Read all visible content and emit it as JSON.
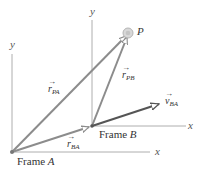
{
  "diagram": {
    "type": "relative-motion-reference-frames",
    "colors": {
      "axis": "#9a9a9a",
      "vector": "#8c8c8c",
      "velocity_vector": "#555555",
      "point": "#b0b0b0",
      "text": "#333333"
    },
    "frames": [
      {
        "name": "Frame A",
        "prefix": "Frame ",
        "letter": "A",
        "x_axis_label": "x",
        "y_axis_label": "y"
      },
      {
        "name": "Frame B",
        "prefix": "Frame ",
        "letter": "B",
        "x_axis_label": "x",
        "y_axis_label": "y"
      }
    ],
    "point": {
      "label": "P"
    },
    "vectors": [
      {
        "id": "r_PA",
        "symbol": "r",
        "subscript": "PA",
        "from": "Frame A origin",
        "to": "P"
      },
      {
        "id": "r_PB",
        "symbol": "r",
        "subscript": "PB",
        "from": "Frame B origin",
        "to": "P"
      },
      {
        "id": "r_BA",
        "symbol": "r",
        "subscript": "BA",
        "from": "Frame A origin",
        "to": "Frame B origin"
      },
      {
        "id": "v_BA",
        "symbol": "v",
        "subscript": "BA",
        "from": "Frame B origin",
        "to": "direction of motion"
      }
    ],
    "arrow_glyph": "→"
  }
}
